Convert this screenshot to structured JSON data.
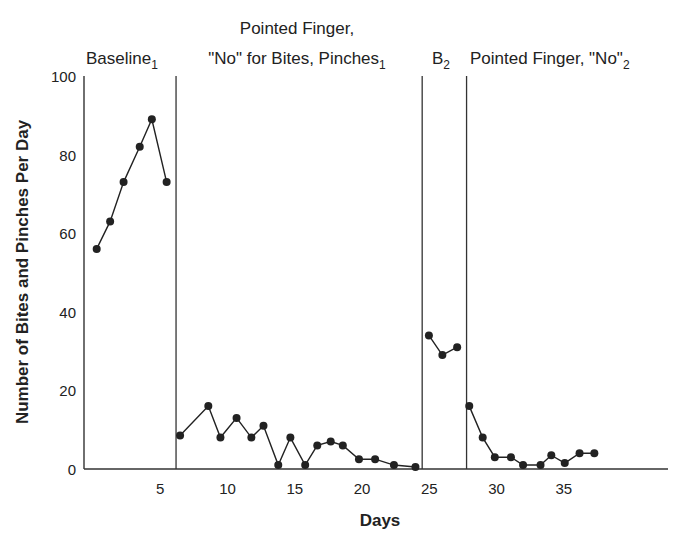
{
  "chart_data": {
    "type": "line",
    "title": "",
    "xlabel": "Days",
    "ylabel": "Number of Bites and Pinches Per Day",
    "ylim": [
      0,
      100
    ],
    "xlim": [
      0,
      43
    ],
    "y_ticks": [
      "0",
      "20",
      "40",
      "60",
      "80",
      "100"
    ],
    "x_ticks": [
      "5",
      "10",
      "15",
      "20",
      "25",
      "30",
      "35"
    ],
    "grid": false,
    "phases": [
      {
        "name": "Baseline",
        "sub": "1",
        "label_line1": "",
        "label_line2": "Baseline"
      },
      {
        "name": "Pointed Finger, \"No\" for Bites, Pinches",
        "sub": "1",
        "label_line1": "Pointed Finger,",
        "label_line2": "\"No\" for Bites, Pinches"
      },
      {
        "name": "B",
        "sub": "2",
        "label_line1": "",
        "label_line2": "B"
      },
      {
        "name": "Pointed Finger, \"No\"",
        "sub": "2",
        "label_line1": "",
        "label_line2": "Pointed Finger, \"No\""
      }
    ],
    "phase_change_days": [
      6.1,
      24.4,
      27.7
    ],
    "series": [
      {
        "name": "Baseline 1",
        "x": [
          0.2,
          1.2,
          2.2,
          3.4,
          4.3,
          5.4
        ],
        "values": [
          56,
          63,
          73,
          82,
          89,
          73
        ]
      },
      {
        "name": "Pointed Finger, No 1",
        "x": [
          6.4,
          8.5,
          9.4,
          10.6,
          11.7,
          12.6,
          13.7,
          14.6,
          15.7,
          16.6,
          17.6,
          18.5,
          19.7,
          20.9,
          22.3,
          23.9
        ],
        "values": [
          8.5,
          16,
          8,
          13,
          8,
          11,
          1,
          8,
          1,
          6,
          7,
          6,
          2.5,
          2.5,
          1,
          0.5
        ]
      },
      {
        "name": "B2",
        "x": [
          24.9,
          25.9,
          27.0
        ],
        "values": [
          34,
          29,
          31
        ]
      },
      {
        "name": "Pointed Finger, No 2",
        "x": [
          27.9,
          28.9,
          29.8,
          31.0,
          31.9,
          33.2,
          34.0,
          35.0,
          36.1,
          37.2
        ],
        "values": [
          16,
          8,
          3,
          3,
          1,
          1,
          3.5,
          1.5,
          4,
          4
        ]
      }
    ]
  }
}
